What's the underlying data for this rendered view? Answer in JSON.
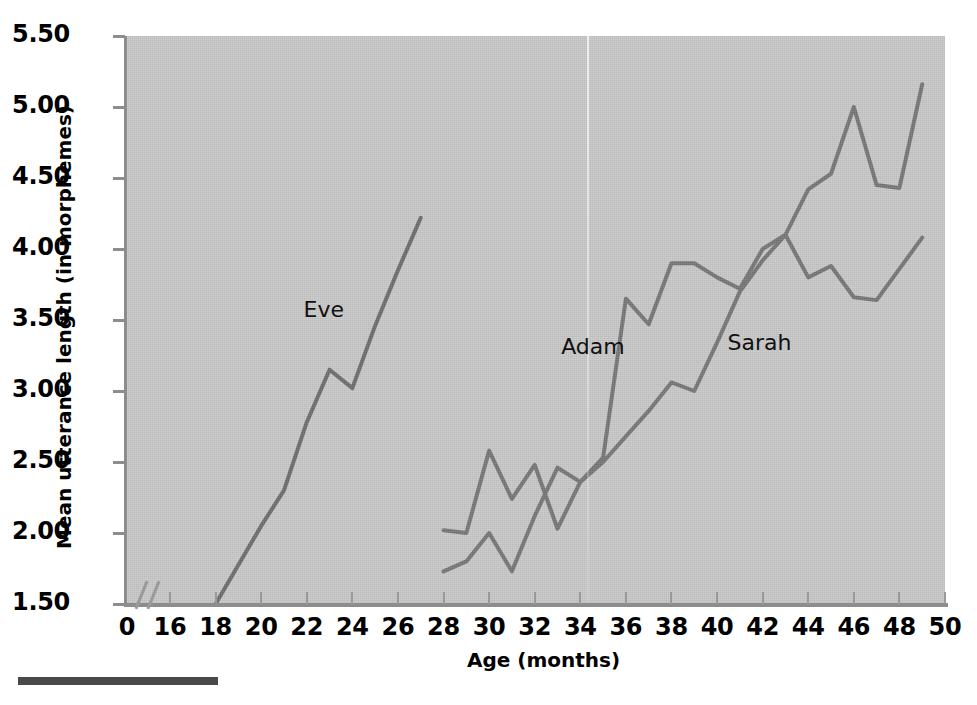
{
  "figure": {
    "y_axis_title": "Mean utterance length (in morphemes)",
    "x_axis_title": "Age (months)",
    "axis_break_marker": "//",
    "footer_rule": ""
  },
  "chart_data": {
    "type": "line",
    "title": "",
    "xlabel": "Age (months)",
    "ylabel": "Mean utterance length (in morphemes)",
    "xlim": [
      16,
      50
    ],
    "ylim": [
      1.5,
      5.5
    ],
    "grid": false,
    "legend": "inline-labels",
    "x_tick_labels": [
      "0",
      "16",
      "18",
      "20",
      "22",
      "24",
      "26",
      "28",
      "30",
      "32",
      "34",
      "36",
      "38",
      "40",
      "42",
      "44",
      "46",
      "48",
      "50"
    ],
    "y_tick_labels": [
      "5.50",
      "5.00",
      "4.50",
      "4.00",
      "3.50",
      "3.00",
      "2.50",
      "2.00",
      "1.50"
    ],
    "axis_break_after": "0",
    "series": [
      {
        "name": "Eve",
        "color": "#6e6e6e",
        "label_x": 23.0,
        "label_y": 3.56,
        "points": [
          {
            "x": 18,
            "y": 1.5
          },
          {
            "x": 20,
            "y": 2.05
          },
          {
            "x": 21,
            "y": 2.3
          },
          {
            "x": 22,
            "y": 2.78
          },
          {
            "x": 23,
            "y": 3.15
          },
          {
            "x": 24,
            "y": 3.02
          },
          {
            "x": 25,
            "y": 3.46
          },
          {
            "x": 26,
            "y": 3.85
          },
          {
            "x": 27,
            "y": 4.22
          }
        ]
      },
      {
        "name": "Adam",
        "color": "#777777",
        "label_x": 34.3,
        "label_y": 3.3,
        "points": [
          {
            "x": 28,
            "y": 2.02
          },
          {
            "x": 29,
            "y": 2.0
          },
          {
            "x": 30,
            "y": 2.58
          },
          {
            "x": 31,
            "y": 2.24
          },
          {
            "x": 32,
            "y": 2.48
          },
          {
            "x": 33,
            "y": 2.03
          },
          {
            "x": 34,
            "y": 2.36
          },
          {
            "x": 35,
            "y": 2.53
          },
          {
            "x": 36,
            "y": 3.65
          },
          {
            "x": 37,
            "y": 3.47
          },
          {
            "x": 38,
            "y": 3.9
          },
          {
            "x": 39,
            "y": 3.9
          },
          {
            "x": 40,
            "y": 3.8
          },
          {
            "x": 41,
            "y": 3.72
          },
          {
            "x": 42,
            "y": 4.0
          },
          {
            "x": 43,
            "y": 4.1
          },
          {
            "x": 44,
            "y": 4.42
          },
          {
            "x": 45,
            "y": 4.53
          },
          {
            "x": 46,
            "y": 5.0
          },
          {
            "x": 47,
            "y": 4.45
          },
          {
            "x": 48,
            "y": 4.43
          },
          {
            "x": 49,
            "y": 5.16
          }
        ]
      },
      {
        "name": "Sarah",
        "color": "#777777",
        "label_x": 41.6,
        "label_y": 3.33,
        "points": [
          {
            "x": 28,
            "y": 1.73
          },
          {
            "x": 29,
            "y": 1.8
          },
          {
            "x": 30,
            "y": 2.0
          },
          {
            "x": 31,
            "y": 1.73
          },
          {
            "x": 32,
            "y": 2.12
          },
          {
            "x": 33,
            "y": 2.46
          },
          {
            "x": 34,
            "y": 2.36
          },
          {
            "x": 35,
            "y": 2.5
          },
          {
            "x": 36,
            "y": 2.68
          },
          {
            "x": 37,
            "y": 2.86
          },
          {
            "x": 38,
            "y": 3.06
          },
          {
            "x": 39,
            "y": 3.0
          },
          {
            "x": 40,
            "y": 3.34
          },
          {
            "x": 41,
            "y": 3.7
          },
          {
            "x": 42,
            "y": 3.92
          },
          {
            "x": 43,
            "y": 4.1
          },
          {
            "x": 44,
            "y": 3.8
          },
          {
            "x": 45,
            "y": 3.88
          },
          {
            "x": 46,
            "y": 3.66
          },
          {
            "x": 47,
            "y": 3.64
          },
          {
            "x": 48,
            "y": 3.86
          },
          {
            "x": 49,
            "y": 4.08
          }
        ]
      }
    ]
  }
}
